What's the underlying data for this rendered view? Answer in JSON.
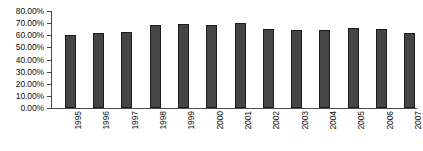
{
  "chart_data": {
    "type": "bar",
    "title": "",
    "subtitle": "",
    "xlabel": "",
    "ylabel": "",
    "categories": [
      "1995",
      "1996",
      "1997",
      "1998",
      "1999",
      "2000",
      "2001",
      "2002",
      "2003",
      "2004",
      "2005",
      "2006",
      "2007"
    ],
    "values": [
      60.0,
      61.5,
      63.0,
      68.5,
      69.0,
      68.5,
      70.0,
      65.0,
      64.5,
      64.5,
      66.0,
      65.0,
      62.0
    ],
    "series": [
      {
        "name": "",
        "values": [
          60.0,
          61.5,
          63.0,
          68.5,
          69.0,
          68.5,
          70.0,
          65.0,
          64.5,
          64.5,
          66.0,
          65.0,
          62.0
        ]
      }
    ],
    "ylim": [
      0,
      80
    ],
    "ytick_values": [
      80,
      70,
      60,
      50,
      40,
      30,
      20,
      10,
      0
    ],
    "ytick_labels": [
      "80.00%",
      "70.00%",
      "60.00%",
      "50.00%",
      "40.00%",
      "30.00%",
      "20.00%",
      "10.00%",
      "0.00%"
    ],
    "grid": false,
    "legend": false,
    "legend_position": "none",
    "bar_color": "#454545",
    "bar_edge_color": "#1c1c1c",
    "axis_color": "#4a4a4a",
    "background_color": "#ffffff",
    "tick_label_color": "#101010",
    "xtick_rotation": 90
  }
}
